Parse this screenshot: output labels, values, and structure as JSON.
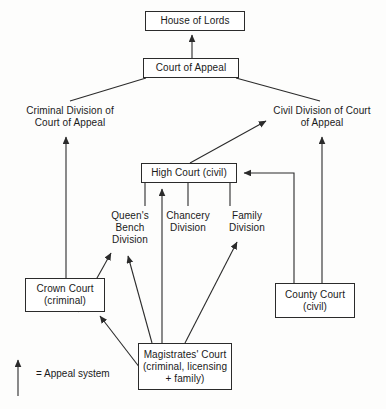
{
  "diagram": {
    "colors": {
      "line": "#2b2b2b",
      "text": "#1a1a1a",
      "background": "#fdfdfc",
      "box_fill": "#ffffff"
    },
    "nodes": [
      {
        "id": "house-of-lords",
        "label": "House of Lords",
        "boxed": true,
        "x": 145,
        "y": 11,
        "w": 100,
        "h": 20
      },
      {
        "id": "court-of-appeal",
        "label": "Court of Appeal",
        "boxed": true,
        "x": 143,
        "y": 58,
        "w": 96,
        "h": 20
      },
      {
        "id": "criminal-division",
        "label": "Criminal Division of\nCourt of Appeal",
        "boxed": false,
        "x": 14,
        "y": 104,
        "w": 112,
        "h": 26
      },
      {
        "id": "civil-division",
        "label": "Civil Division of Court\nof Appeal",
        "boxed": false,
        "x": 263,
        "y": 104,
        "w": 118,
        "h": 26
      },
      {
        "id": "high-court",
        "label": "High Court (civil)",
        "boxed": true,
        "x": 141,
        "y": 163,
        "w": 96,
        "h": 20
      },
      {
        "id": "queens-bench",
        "label": "Queen's\nBench\nDivision",
        "boxed": false,
        "x": 105,
        "y": 208,
        "w": 50,
        "h": 40
      },
      {
        "id": "chancery",
        "label": "Chancery\nDivision",
        "boxed": false,
        "x": 160,
        "y": 208,
        "w": 56,
        "h": 28
      },
      {
        "id": "family",
        "label": "Family\nDivision",
        "boxed": false,
        "x": 222,
        "y": 208,
        "w": 50,
        "h": 28
      },
      {
        "id": "crown-court",
        "label": "Crown Court\n(criminal)",
        "boxed": true,
        "x": 25,
        "y": 278,
        "w": 80,
        "h": 34
      },
      {
        "id": "county-court",
        "label": "County Court\n(civil)",
        "boxed": true,
        "x": 275,
        "y": 283,
        "w": 80,
        "h": 35
      },
      {
        "id": "magistrates-court",
        "label": "Magistrates' Court\n(criminal, licensing\n+ family)",
        "boxed": true,
        "x": 138,
        "y": 343,
        "w": 94,
        "h": 47
      }
    ],
    "edges": [
      {
        "id": "court-of-appeal-to-house-of-lords",
        "from": "court-of-appeal",
        "to": "house-of-lords",
        "arrow": "end"
      },
      {
        "id": "court-of-appeal-to-criminal-division",
        "from": "court-of-appeal",
        "to": "criminal-division",
        "arrow": "none"
      },
      {
        "id": "court-of-appeal-to-civil-division",
        "from": "court-of-appeal",
        "to": "civil-division",
        "arrow": "none"
      },
      {
        "id": "crown-court-to-criminal-division",
        "from": "crown-court",
        "to": "criminal-division",
        "arrow": "end"
      },
      {
        "id": "crown-court-to-queens-bench",
        "from": "crown-court",
        "to": "queens-bench",
        "arrow": "end"
      },
      {
        "id": "high-court-to-civil-division",
        "from": "high-court",
        "to": "civil-division",
        "arrow": "end"
      },
      {
        "id": "county-court-to-civil-division",
        "from": "county-court",
        "to": "civil-division",
        "arrow": "end"
      },
      {
        "id": "county-court-to-high-court",
        "from": "county-court",
        "to": "high-court",
        "arrow": "end"
      },
      {
        "id": "queens-bench-to-high-court",
        "from": "queens-bench",
        "to": "high-court",
        "arrow": "none"
      },
      {
        "id": "chancery-to-high-court",
        "from": "chancery",
        "to": "high-court",
        "arrow": "none"
      },
      {
        "id": "family-to-high-court",
        "from": "family",
        "to": "high-court",
        "arrow": "none"
      },
      {
        "id": "magistrates-to-high-court",
        "from": "magistrates-court",
        "to": "high-court",
        "arrow": "end"
      },
      {
        "id": "magistrates-to-crown-court",
        "from": "magistrates-court",
        "to": "crown-court",
        "arrow": "end"
      },
      {
        "id": "magistrates-to-queens-bench",
        "from": "magistrates-court",
        "to": "queens-bench",
        "arrow": "end"
      },
      {
        "id": "magistrates-to-family",
        "from": "magistrates-court",
        "to": "family",
        "arrow": "end"
      }
    ],
    "legend": {
      "text": "= Appeal system",
      "arrow_meaning": "appeal-direction-arrow"
    }
  }
}
